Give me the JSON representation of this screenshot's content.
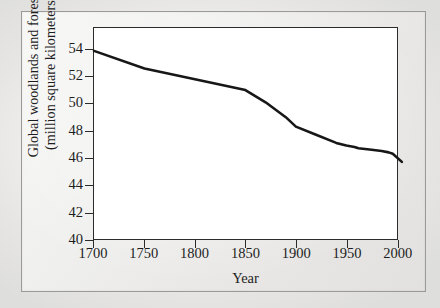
{
  "figure": {
    "background_color": "#eceae8",
    "frame_color": "#9a9a98"
  },
  "chart_data": {
    "type": "line",
    "title": "",
    "xlabel": "Year",
    "ylabel": "Global woodlands and forests (million square kilometers)",
    "ylabel_line1": "Global woodlands and forests",
    "ylabel_line2": "(million square kilometers)",
    "xlim": [
      1700,
      2010
    ],
    "ylim": [
      40,
      55
    ],
    "xticks": [
      1700,
      1750,
      1800,
      1850,
      1900,
      1950,
      2000
    ],
    "xtick_labels": [
      "1700",
      "1750",
      "1800",
      "1850",
      "1900",
      "1950",
      "2000"
    ],
    "yticks": [
      40,
      42,
      44,
      46,
      48,
      50,
      52,
      54
    ],
    "ytick_labels": [
      "40",
      "42",
      "44",
      "46",
      "48",
      "50",
      "52",
      "54"
    ],
    "grid": false,
    "legend": null,
    "line_color": "#171717",
    "line_width": 2.6,
    "series": [
      {
        "name": "Global woodlands and forests",
        "x": [
          1700,
          1750,
          1800,
          1850,
          1870,
          1890,
          1900,
          1920,
          1940,
          1950,
          1958,
          1962,
          1975,
          1985,
          1992,
          1996,
          2005
        ],
        "values": [
          53.9,
          52.6,
          51.8,
          51.0,
          50.1,
          49.0,
          48.3,
          47.7,
          47.1,
          46.9,
          46.8,
          46.7,
          46.6,
          46.5,
          46.4,
          46.3,
          45.7
        ]
      }
    ]
  }
}
